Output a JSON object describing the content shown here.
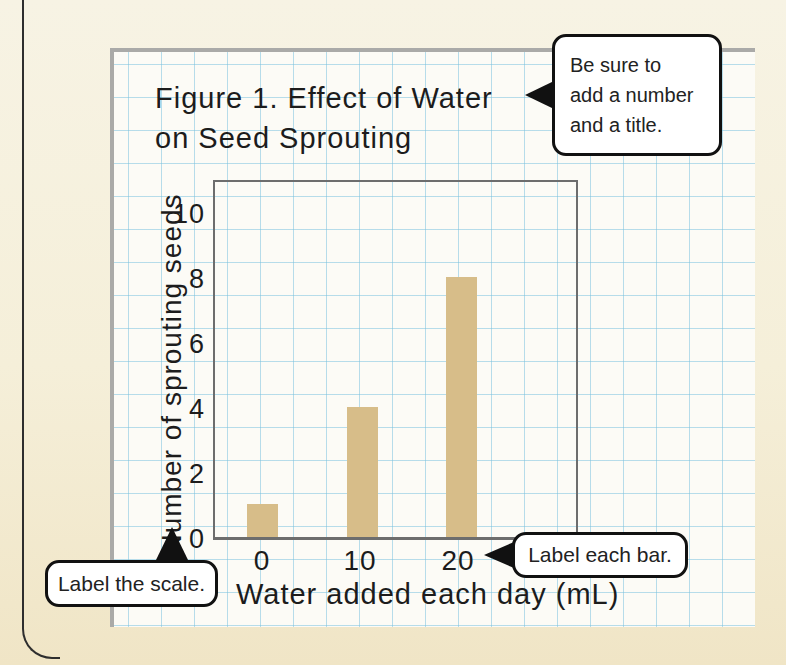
{
  "figure": {
    "title_line1": "Figure 1. Effect of Water",
    "title_line2": "on Seed Sprouting"
  },
  "chart_data": {
    "type": "bar",
    "title": "Figure 1. Effect of Water on Seed Sprouting",
    "categories": [
      "0",
      "10",
      "20"
    ],
    "values": [
      1,
      4,
      8
    ],
    "xlabel": "Water added each day (mL)",
    "ylabel": "Number of sprouting seeds",
    "ylim": [
      0,
      11
    ],
    "yticks": [
      "0",
      "2",
      "4",
      "6",
      "8",
      "10"
    ],
    "grid": true,
    "legend": "none",
    "bar_color": "#d7bd89",
    "pixels_per_unit": 32.5
  },
  "colors": {
    "page_background": "#f5efd9",
    "paper_background": "#fcfbf6",
    "grid_line": "#7dc3e0",
    "paper_border": "#aaaaa8",
    "plot_border": "#6d6d6d",
    "bar": "#d7bd89",
    "callout_border": "#111111"
  },
  "callouts": [
    {
      "id": "title-note",
      "lines": [
        "Be sure to",
        "add a number",
        "and a title."
      ],
      "arrow": "left"
    },
    {
      "id": "bar-note",
      "text": "Label each bar.",
      "arrow": "left"
    },
    {
      "id": "scale-note",
      "text": "Label the scale.",
      "arrow": "up"
    }
  ]
}
